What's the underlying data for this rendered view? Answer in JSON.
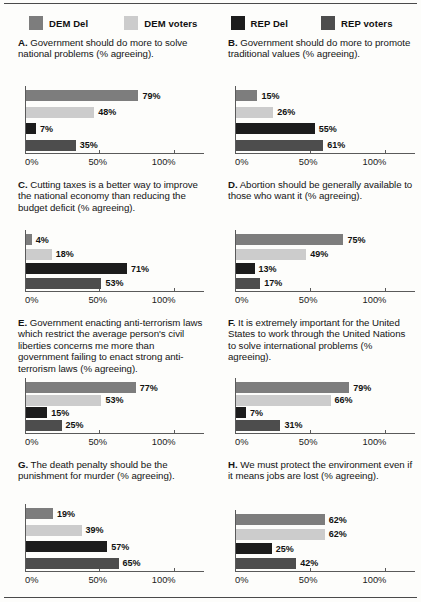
{
  "legend": {
    "items": [
      {
        "label": "DEM Del",
        "color": "#7d7d7d",
        "key": "dem_del"
      },
      {
        "label": "DEM voters",
        "color": "#cccccc",
        "key": "dem_voters"
      },
      {
        "label": "REP Del",
        "color": "#1c1c1c",
        "key": "rep_del"
      },
      {
        "label": "REP voters",
        "color": "#4d4d4d",
        "key": "rep_voters"
      }
    ]
  },
  "axis": {
    "ticks": [
      "0%",
      "50%",
      "100%"
    ],
    "tick_values": [
      0,
      50,
      100
    ],
    "min": 0,
    "max": 100
  },
  "chart_data": {
    "type": "bar",
    "xlabel": "% agreeing",
    "ylabel": "",
    "xlim": [
      0,
      100
    ],
    "grid": false,
    "legend_position": "top",
    "orientation": "horizontal",
    "categories": [
      "DEM Del",
      "DEM voters",
      "REP Del",
      "REP voters"
    ],
    "series_colors": [
      "#7d7d7d",
      "#cccccc",
      "#1c1c1c",
      "#4d4d4d"
    ],
    "panels": [
      {
        "id": "A",
        "letter": "A.",
        "title": "Government should do more to solve national problems (% agreeing).",
        "title_lines": 2,
        "values": [
          79,
          48,
          7,
          35
        ],
        "labels": [
          "79%",
          "48%",
          "7%",
          "35%"
        ]
      },
      {
        "id": "B",
        "letter": "B.",
        "title": "Government should do more to promote traditional values (% agreeing).",
        "title_lines": 2,
        "values": [
          15,
          26,
          55,
          61
        ],
        "labels": [
          "15%",
          "26%",
          "55%",
          "61%"
        ]
      },
      {
        "id": "C",
        "letter": "C.",
        "title": "Cutting taxes is a better way to improve the national economy than reducing the budget deficit (% agreeing).",
        "title_lines": 3,
        "values": [
          4,
          18,
          71,
          53
        ],
        "labels": [
          "4%",
          "18%",
          "71%",
          "53%"
        ]
      },
      {
        "id": "D",
        "letter": "D.",
        "title": "Abortion should be generally available to those who want it (% agreeing).",
        "title_lines": 3,
        "values": [
          75,
          49,
          13,
          17
        ],
        "labels": [
          "75%",
          "49%",
          "13%",
          "17%"
        ]
      },
      {
        "id": "E",
        "letter": "E.",
        "title": "Government enacting anti-terrorism laws which restrict the average person's civil liberties concerns me more than government failing to enact strong anti-terrorism laws (% agreeing).",
        "title_lines": 5,
        "values": [
          77,
          53,
          15,
          25
        ],
        "labels": [
          "77%",
          "53%",
          "15%",
          "25%"
        ]
      },
      {
        "id": "F",
        "letter": "F.",
        "title": "It is extremely important for the United States to work through the United Nations to solve international problems (% agreeing).",
        "title_lines": 4,
        "values": [
          79,
          66,
          7,
          31
        ],
        "labels": [
          "79%",
          "66%",
          "7%",
          "31%"
        ]
      },
      {
        "id": "G",
        "letter": "G.",
        "title": "The death penalty should be the punishment for murder (% agreeing).",
        "title_lines": 2,
        "values": [
          19,
          39,
          57,
          65
        ],
        "labels": [
          "19%",
          "39%",
          "57%",
          "65%"
        ]
      },
      {
        "id": "H",
        "letter": "H.",
        "title": "We must protect the environment even if it means jobs are lost (% agreeing).",
        "title_lines": 3,
        "values": [
          62,
          62,
          25,
          42
        ],
        "labels": [
          "62%",
          "62%",
          "25%",
          "42%"
        ]
      }
    ]
  }
}
